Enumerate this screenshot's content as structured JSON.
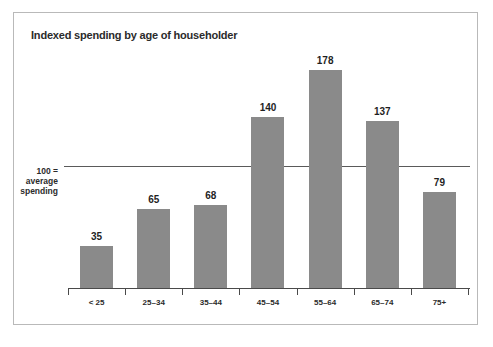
{
  "chart_data": {
    "type": "bar",
    "title": "Indexed spending by age of householder",
    "xlabel": "",
    "ylabel": "",
    "categories": [
      "< 25",
      "25–34",
      "35–44",
      "45–54",
      "55–64",
      "65–74",
      "75+"
    ],
    "values": [
      35,
      65,
      68,
      140,
      178,
      137,
      79
    ],
    "ylim": [
      0,
      200
    ],
    "grid": false,
    "legend": null,
    "reference_line": {
      "value": 100,
      "label_line1": "100 =",
      "label_line2": "average",
      "label_line3": "spending"
    },
    "annotations": {
      "data_labels": [
        "35",
        "65",
        "68",
        "140",
        "178",
        "137",
        "79"
      ]
    },
    "colors": {
      "bar": "#8a8a8a",
      "axis": "#4a4a4a",
      "reference_line": "#5a5a5a",
      "text": "#2b2b2b",
      "frame": "#b9b9b9",
      "background": "#ffffff"
    }
  }
}
